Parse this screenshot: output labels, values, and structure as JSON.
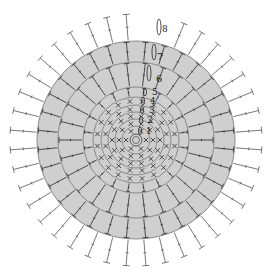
{
  "diagram": {
    "title": "",
    "type": "crochet-round-chart",
    "center": {
      "x": 136,
      "y": 140
    },
    "disk_radius": 99,
    "ring_radii": [
      5,
      14,
      21,
      28,
      35,
      43,
      53,
      78,
      99
    ],
    "colors": {
      "disk": "#cfcfcf",
      "ring_line": "#8a8a8a",
      "stitch": "#3a3a3a",
      "background": "#ffffff"
    },
    "center_symbol": "magic-ring",
    "round_labels": [
      {
        "id": "1",
        "text": "1",
        "x": 146,
        "y": 133
      },
      {
        "id": "2",
        "text": "2",
        "x": 148,
        "y": 122
      },
      {
        "id": "3",
        "text": "3",
        "x": 150,
        "y": 112
      },
      {
        "id": "4",
        "text": "4",
        "x": 150,
        "y": 103
      },
      {
        "id": "5",
        "text": "5",
        "x": 152,
        "y": 94
      },
      {
        "id": "6",
        "text": "6",
        "x": 156,
        "y": 81
      },
      {
        "id": "7",
        "text": "7",
        "x": 157,
        "y": 58
      },
      {
        "id": "8",
        "text": "8",
        "x": 162,
        "y": 31
      }
    ],
    "legend": {
      "x_stitch": "single crochet (X)",
      "v_stitch": "double crochet increase (V)",
      "t_stitch": "double crochet (T)",
      "slip": "slip stitch / chain start"
    }
  }
}
